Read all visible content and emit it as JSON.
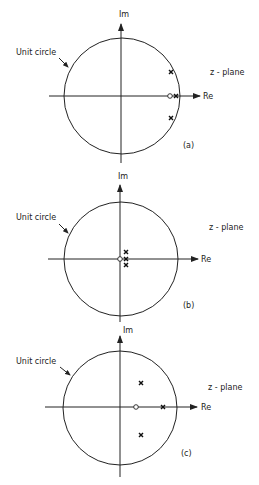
{
  "figure": {
    "panels": [
      {
        "id": "a",
        "caption": "(a)",
        "plane_label": "z - plane",
        "unit_circle_label": "Unit circle",
        "axes": {
          "real": "Re",
          "imag": "Im"
        },
        "zeros": [
          {
            "re": 0.83,
            "im": 0.0
          }
        ],
        "poles": [
          {
            "re": 0.93,
            "im": 0.0
          },
          {
            "re": 0.84,
            "im": 0.41
          },
          {
            "re": 0.84,
            "im": -0.38
          }
        ]
      },
      {
        "id": "b",
        "caption": "(b)",
        "plane_label": "z - plane",
        "unit_circle_label": "Unit circle",
        "axes": {
          "real": "Re",
          "imag": "Im"
        },
        "zeros": [
          {
            "re": 0.0,
            "im": 0.0
          }
        ],
        "poles": [
          {
            "re": 0.09,
            "im": 0.0
          },
          {
            "re": 0.09,
            "im": 0.12
          },
          {
            "re": 0.09,
            "im": -0.11
          }
        ]
      },
      {
        "id": "c",
        "caption": "(c)",
        "plane_label": "z - plane",
        "unit_circle_label": "Unit circle",
        "axes": {
          "real": "Re",
          "imag": "Im"
        },
        "zeros": [
          {
            "re": 0.28,
            "im": 0.0
          }
        ],
        "poles": [
          {
            "re": 0.75,
            "im": 0.0
          },
          {
            "re": 0.37,
            "im": 0.44
          },
          {
            "re": 0.37,
            "im": -0.47
          }
        ]
      }
    ]
  },
  "colors": {
    "ink": "#222222",
    "background": "#ffffff"
  }
}
